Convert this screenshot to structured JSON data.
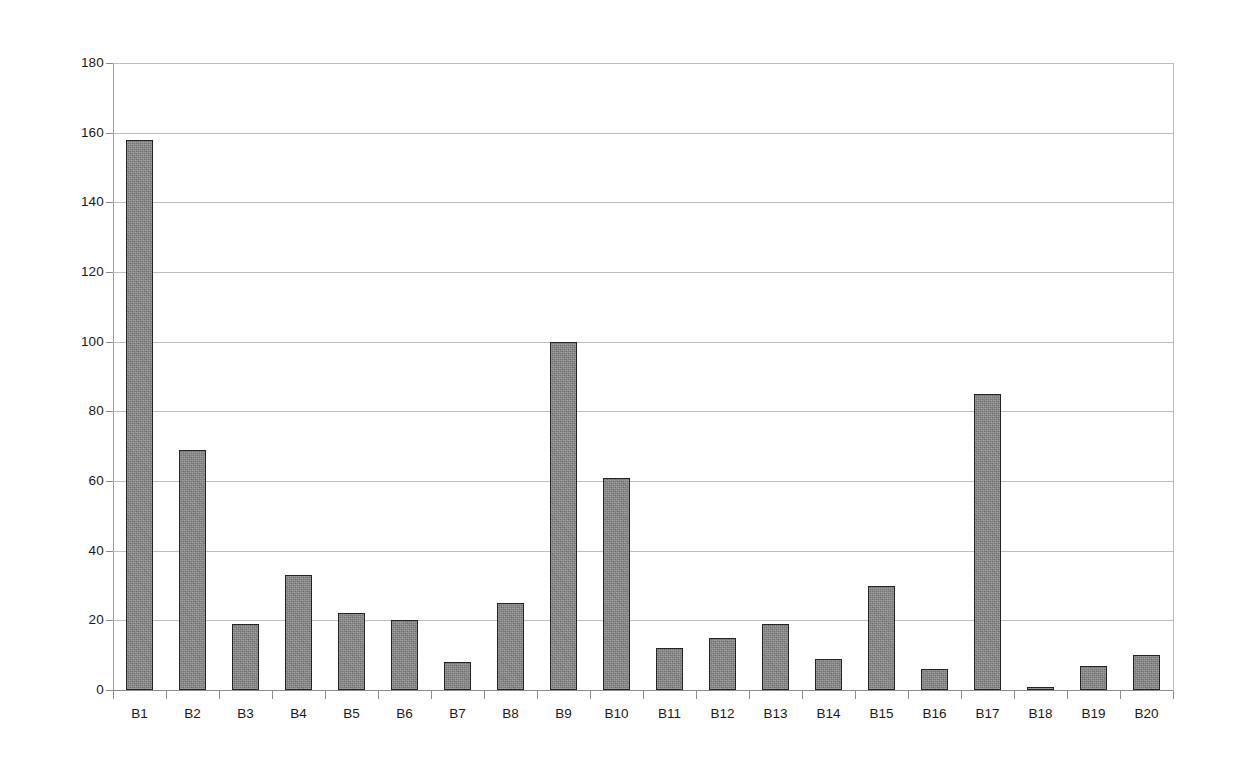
{
  "chart_data": {
    "type": "bar",
    "title": "",
    "subtitle": "",
    "xlabel": "",
    "ylabel": "",
    "ylim": [
      0,
      180
    ],
    "ytick_step": 20,
    "ytick_labels": [
      "0",
      "20",
      "40",
      "60",
      "80",
      "100",
      "120",
      "140",
      "160",
      "180"
    ],
    "ytick_values": [
      0,
      20,
      40,
      60,
      80,
      100,
      120,
      140,
      160,
      180
    ],
    "grid": true,
    "grid_axis": "y",
    "legend": false,
    "legend_position": "none",
    "categories": [
      "B1",
      "B2",
      "B3",
      "B4",
      "B5",
      "B6",
      "B7",
      "B8",
      "B9",
      "B10",
      "B11",
      "B12",
      "B13",
      "B14",
      "B15",
      "B16",
      "B17",
      "B18",
      "B19",
      "B20"
    ],
    "values": [
      158,
      69,
      19,
      33,
      22,
      20,
      8,
      25,
      100,
      61,
      12,
      15,
      19,
      9,
      30,
      6,
      85,
      1,
      7,
      10
    ],
    "annotations": [],
    "bar_fill_color": "#848484",
    "bar_edge_color": "#242424",
    "gridline_color": "#bdbdbd",
    "axis_color": "#8c8c8c",
    "background_color": "#ffffff",
    "text_color": "#1a1a1a"
  }
}
